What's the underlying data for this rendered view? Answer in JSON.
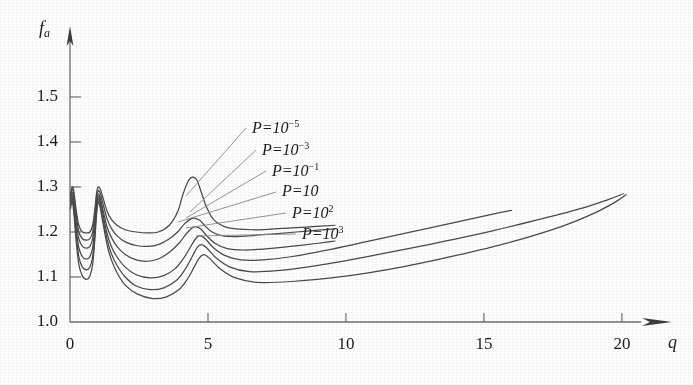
{
  "chart_data": {
    "type": "line",
    "title": "",
    "subtitle": "",
    "xlabel": "q",
    "ylabel": "f_a",
    "ylabel_display": "fa",
    "xlim": [
      0,
      21.2
    ],
    "ylim": [
      1.0,
      1.56
    ],
    "grid": false,
    "legend_position": "inline-annotations",
    "xticks": [
      0,
      5,
      10,
      15,
      20
    ],
    "xticklabels": [
      "0",
      "5",
      "10",
      "15",
      "20"
    ],
    "yticks": [
      1.0,
      1.1,
      1.2,
      1.3,
      1.4,
      1.5
    ],
    "yticklabels": [
      "1.0",
      "1.1",
      "1.2",
      "1.3",
      "1.4",
      "1.5"
    ],
    "axis_style": "arrow-tipped open axes",
    "annotations": [
      {
        "text": "P=10-5",
        "display": "P=10",
        "exponent": "−5"
      },
      {
        "text": "P=10-3",
        "display": "P=10",
        "exponent": "−3"
      },
      {
        "text": "P=10-1",
        "display": "P=10",
        "exponent": "−1"
      },
      {
        "text": "P=10",
        "display": "P=10",
        "exponent": ""
      },
      {
        "text": "P=102",
        "display": "P=10",
        "exponent": "2"
      },
      {
        "text": "P=103",
        "display": "P=10",
        "exponent": "3"
      }
    ],
    "series": [
      {
        "name": "P=10^-5",
        "x": [
          0.02,
          0.08,
          0.14,
          0.22,
          0.32,
          0.45,
          0.6,
          0.72,
          0.82,
          0.9,
          0.96,
          1.02,
          1.1,
          1.2,
          1.35,
          1.5,
          1.7,
          2.0,
          2.4,
          2.8,
          3.2,
          3.6,
          3.9,
          4.1,
          4.3,
          4.45,
          4.6,
          4.75,
          4.95,
          5.2,
          5.6,
          6.0,
          6.6,
          7.2,
          8.0,
          8.8,
          9.6
        ],
        "y": [
          1.285,
          1.3,
          1.29,
          1.25,
          1.215,
          1.2,
          1.198,
          1.2,
          1.215,
          1.25,
          1.285,
          1.3,
          1.295,
          1.275,
          1.245,
          1.228,
          1.215,
          1.205,
          1.2,
          1.198,
          1.2,
          1.215,
          1.245,
          1.285,
          1.315,
          1.322,
          1.315,
          1.29,
          1.255,
          1.228,
          1.212,
          1.207,
          1.205,
          1.206,
          1.209,
          1.212,
          1.215
        ]
      },
      {
        "name": "P=10^-3",
        "x": [
          0.02,
          0.08,
          0.14,
          0.22,
          0.32,
          0.45,
          0.6,
          0.72,
          0.82,
          0.9,
          0.96,
          1.02,
          1.1,
          1.2,
          1.35,
          1.5,
          1.7,
          2.0,
          2.4,
          2.8,
          3.2,
          3.6,
          3.9,
          4.15,
          4.35,
          4.5,
          4.7,
          4.9,
          5.15,
          5.5,
          6.0,
          6.6,
          7.4,
          8.2,
          9.0,
          9.6
        ],
        "y": [
          1.28,
          1.295,
          1.282,
          1.24,
          1.2,
          1.185,
          1.182,
          1.185,
          1.2,
          1.24,
          1.275,
          1.292,
          1.285,
          1.262,
          1.228,
          1.208,
          1.192,
          1.178,
          1.17,
          1.168,
          1.172,
          1.185,
          1.2,
          1.218,
          1.228,
          1.231,
          1.226,
          1.213,
          1.2,
          1.192,
          1.19,
          1.192,
          1.196,
          1.2,
          1.204,
          1.207
        ]
      },
      {
        "name": "P=10^-1",
        "x": [
          0.02,
          0.08,
          0.14,
          0.22,
          0.32,
          0.45,
          0.6,
          0.72,
          0.82,
          0.9,
          0.96,
          1.02,
          1.1,
          1.2,
          1.35,
          1.5,
          1.7,
          2.0,
          2.4,
          2.8,
          3.2,
          3.6,
          3.95,
          4.2,
          4.4,
          4.55,
          4.75,
          4.95,
          5.25,
          5.7,
          6.3,
          7.0,
          8.0,
          9.0,
          9.6
        ],
        "y": [
          1.275,
          1.288,
          1.272,
          1.225,
          1.185,
          1.168,
          1.164,
          1.168,
          1.185,
          1.225,
          1.265,
          1.284,
          1.275,
          1.248,
          1.21,
          1.188,
          1.168,
          1.15,
          1.138,
          1.135,
          1.14,
          1.155,
          1.175,
          1.195,
          1.208,
          1.212,
          1.206,
          1.192,
          1.175,
          1.163,
          1.16,
          1.162,
          1.168,
          1.175,
          1.18
        ]
      },
      {
        "name": "P=10",
        "x": [
          0.02,
          0.08,
          0.14,
          0.22,
          0.32,
          0.45,
          0.6,
          0.72,
          0.82,
          0.9,
          0.96,
          1.02,
          1.1,
          1.2,
          1.35,
          1.5,
          1.7,
          2.0,
          2.4,
          2.9,
          3.4,
          3.8,
          4.1,
          4.35,
          4.55,
          4.7,
          4.9,
          5.2,
          5.6,
          6.2,
          7.0,
          8.0,
          9.5,
          11.0,
          12.5,
          14.0,
          15.2,
          16.0
        ],
        "y": [
          1.268,
          1.282,
          1.262,
          1.21,
          1.165,
          1.145,
          1.14,
          1.145,
          1.165,
          1.21,
          1.255,
          1.278,
          1.268,
          1.238,
          1.195,
          1.168,
          1.145,
          1.122,
          1.105,
          1.098,
          1.103,
          1.118,
          1.14,
          1.165,
          1.185,
          1.192,
          1.185,
          1.165,
          1.148,
          1.138,
          1.138,
          1.145,
          1.162,
          1.182,
          1.202,
          1.222,
          1.238,
          1.248
        ]
      },
      {
        "name": "P=10^2",
        "x": [
          0.02,
          0.08,
          0.14,
          0.22,
          0.32,
          0.45,
          0.6,
          0.72,
          0.82,
          0.9,
          0.96,
          1.02,
          1.1,
          1.2,
          1.35,
          1.5,
          1.7,
          2.0,
          2.4,
          2.9,
          3.4,
          3.85,
          4.15,
          4.4,
          4.6,
          4.75,
          4.95,
          5.3,
          5.8,
          6.5,
          7.5,
          9.0,
          11.0,
          13.0,
          15.0,
          17.0,
          18.5,
          19.5,
          20.05
        ],
        "y": [
          1.26,
          1.275,
          1.252,
          1.195,
          1.145,
          1.122,
          1.116,
          1.122,
          1.145,
          1.195,
          1.245,
          1.272,
          1.26,
          1.228,
          1.182,
          1.152,
          1.126,
          1.1,
          1.08,
          1.072,
          1.076,
          1.092,
          1.115,
          1.142,
          1.165,
          1.172,
          1.165,
          1.142,
          1.122,
          1.112,
          1.114,
          1.126,
          1.148,
          1.172,
          1.198,
          1.228,
          1.252,
          1.272,
          1.285
        ]
      },
      {
        "name": "P=10^3",
        "x": [
          0.02,
          0.08,
          0.14,
          0.22,
          0.32,
          0.45,
          0.6,
          0.72,
          0.82,
          0.9,
          0.96,
          1.02,
          1.1,
          1.2,
          1.35,
          1.5,
          1.7,
          2.0,
          2.45,
          3.0,
          3.5,
          3.95,
          4.25,
          4.5,
          4.68,
          4.85,
          5.05,
          5.45,
          6.0,
          6.8,
          8.0,
          10.0,
          12.0,
          14.0,
          16.0,
          17.8,
          19.0,
          19.8,
          20.15
        ],
        "y": [
          1.252,
          1.268,
          1.242,
          1.182,
          1.128,
          1.102,
          1.095,
          1.102,
          1.128,
          1.182,
          1.238,
          1.266,
          1.252,
          1.218,
          1.17,
          1.138,
          1.11,
          1.082,
          1.062,
          1.052,
          1.056,
          1.072,
          1.095,
          1.122,
          1.142,
          1.15,
          1.142,
          1.118,
          1.098,
          1.088,
          1.09,
          1.102,
          1.122,
          1.148,
          1.178,
          1.212,
          1.242,
          1.268,
          1.283
        ]
      }
    ]
  },
  "axes": {
    "y_label_main": "f",
    "y_label_sub": "a",
    "x_label": "q"
  },
  "style": {
    "line_color": "#4a4a4a",
    "axis_color": "#6e6e6e",
    "text_color": "#1b1b1b",
    "background": "#ffffff"
  }
}
